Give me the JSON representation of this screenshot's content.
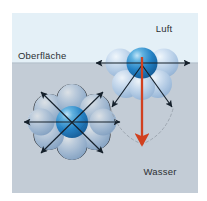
{
  "figure": {
    "labels": {
      "air": "Luft",
      "surface": "Oberfläche",
      "water": "Wasser"
    },
    "colors": {
      "air_fill": "#e4f0f7",
      "water_fill": "#c3ccd6",
      "sphere_light": "#b8cfe8",
      "sphere_light_edge": "#8fb0d4",
      "sphere_core": "#1f7fc4",
      "sphere_core_dark": "#0f5e9c",
      "sphere_core_highlight": "#a8d8f2",
      "arrow_black": "#15202b",
      "arrow_red": "#d1401f",
      "dashed_grey": "#9aa3ad",
      "text": "#2b2f33",
      "page_bg": "#ffffff"
    },
    "regions": [
      {
        "name": "air-region",
        "label": "Luft",
        "boundary_y": 49
      },
      {
        "name": "water-region",
        "label": "Wasser"
      }
    ],
    "molecules": [
      {
        "name": "bulk-molecule",
        "description": "Wassermolekül im Inneren der Flüssigkeit",
        "center": {
          "x": 60,
          "y": 109
        },
        "neighbor_count": 6,
        "force_arrows": 6,
        "net_force": "0",
        "arrow_color": "#15202b"
      },
      {
        "name": "surface-molecule",
        "description": "Wassermolekül an der Oberfläche",
        "center": {
          "x": 130,
          "y": 50
        },
        "neighbor_count": 4,
        "force_arrows": 4,
        "net_force": "nach unten",
        "net_force_color": "#d1401f"
      }
    ]
  }
}
